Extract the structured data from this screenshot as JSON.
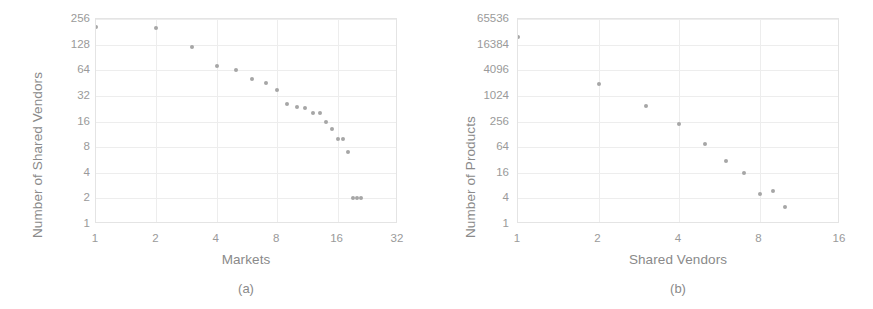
{
  "figure": {
    "panel_count": 2,
    "background_color": "#ffffff",
    "point_color": "#a6a6a6",
    "grid_color": "#ededed",
    "text_color": "#8a8a8a"
  },
  "panels": [
    {
      "id": "a",
      "caption": "(a)",
      "chart_data": {
        "type": "scatter",
        "title": "",
        "xlabel": "Markets",
        "ylabel": "Number of Shared Vendors",
        "xscale": "log2",
        "yscale": "log2",
        "xlim": [
          1,
          32
        ],
        "ylim": [
          1,
          256
        ],
        "xticks": [
          "1",
          "2",
          "4",
          "8",
          "16",
          "32"
        ],
        "xtick_values": [
          1,
          2,
          4,
          8,
          16,
          32
        ],
        "yticks": [
          "256",
          "128",
          "64",
          "32",
          "16",
          "8",
          "4",
          "2",
          "1"
        ],
        "ytick_values": [
          256,
          128,
          64,
          32,
          16,
          8,
          4,
          2,
          1
        ],
        "grid": true,
        "legend": "none",
        "x": [
          1,
          2,
          3,
          4,
          5,
          6,
          7,
          8,
          9,
          10,
          11,
          12,
          13,
          14,
          15,
          16,
          17,
          18,
          19,
          20,
          21
        ],
        "y": [
          205,
          200,
          120,
          72,
          64,
          51,
          45,
          38,
          26,
          24,
          23,
          20,
          20,
          16,
          13,
          10,
          10,
          7,
          2,
          2,
          2
        ],
        "point_count": 21
      }
    },
    {
      "id": "b",
      "caption": "(b)",
      "chart_data": {
        "type": "scatter",
        "title": "",
        "xlabel": "Shared Vendors",
        "ylabel": "Number of Products",
        "xscale": "log2",
        "yscale": "log4",
        "xlim": [
          1,
          16
        ],
        "ylim": [
          1,
          65536
        ],
        "xticks": [
          "1",
          "2",
          "4",
          "8",
          "16"
        ],
        "xtick_values": [
          1,
          2,
          4,
          8,
          16
        ],
        "yticks": [
          "65536",
          "16384",
          "4096",
          "1024",
          "256",
          "64",
          "16",
          "4",
          "1"
        ],
        "ytick_values": [
          65536,
          16384,
          4096,
          1024,
          256,
          64,
          16,
          4,
          1
        ],
        "grid": true,
        "legend": "none",
        "x": [
          1,
          2,
          3,
          4,
          5,
          6,
          7,
          8,
          9,
          10
        ],
        "y": [
          25000,
          2000,
          600,
          220,
          75,
          30,
          16,
          5,
          6,
          2.5
        ],
        "point_count": 10
      }
    }
  ]
}
